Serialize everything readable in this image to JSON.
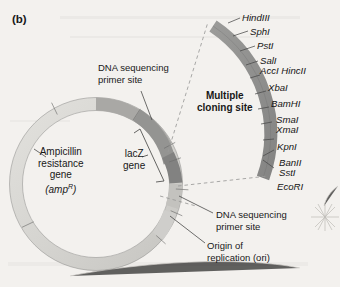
{
  "figure": {
    "panel_letter": "(b)",
    "type": "plasmid-vector-map",
    "background_color": "#f3f1ee"
  },
  "plasmid": {
    "ring_color_light": "#d9d8d4",
    "ring_color_mid": "#b9b8b4",
    "ring_color_dark": "#8e8e8c",
    "outline_color": "#6f6f6d",
    "labels": {
      "ampicillin": {
        "line1": "Ampicillin",
        "line2": "resistance",
        "line3": "gene",
        "line4_prefix": "(amp",
        "line4_sup": "R",
        "line4_suffix": ")"
      },
      "lacz": {
        "line1": "lacZ",
        "line2": "gene"
      },
      "dna_primer_top": {
        "line1": "DNA sequencing",
        "line2": "primer site"
      },
      "dna_primer_bottom": {
        "line1": "DNA sequencing",
        "line2": "primer site"
      },
      "origin": {
        "line1": "Origin of",
        "line2": "replication (ori)"
      }
    }
  },
  "mcs": {
    "title_line1": "Multiple",
    "title_line2": "cloning site",
    "arc_color": "#919190",
    "restriction_sites": [
      {
        "name": "HindIII"
      },
      {
        "name": "SphI"
      },
      {
        "name": "PstI"
      },
      {
        "name": "SalI"
      },
      {
        "name": "AccI HincII"
      },
      {
        "name": "XbaI"
      },
      {
        "name": "BamHI"
      },
      {
        "name": "SmaI"
      },
      {
        "name": "XmaI"
      },
      {
        "name": "KpnI"
      },
      {
        "name": "BanII"
      },
      {
        "name": "SstI"
      },
      {
        "name": "EcoRI"
      }
    ]
  }
}
